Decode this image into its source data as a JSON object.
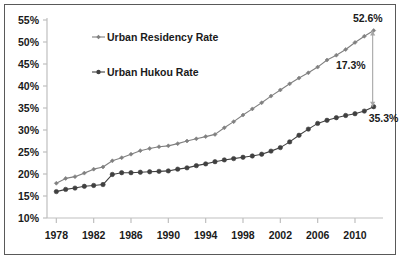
{
  "chart_data": {
    "type": "line",
    "title": "",
    "xlabel": "",
    "ylabel": "",
    "xlim": [
      1977,
      2013
    ],
    "ylim": [
      10,
      55
    ],
    "ytick_labels": [
      "55%",
      "50%",
      "45%",
      "40%",
      "35%",
      "30%",
      "25%",
      "20%",
      "15%",
      "10%"
    ],
    "ytick_values": [
      55,
      50,
      45,
      40,
      35,
      30,
      25,
      20,
      15,
      10
    ],
    "xtick_labels": [
      "1978",
      "1982",
      "1986",
      "1990",
      "1994",
      "1998",
      "2002",
      "2006",
      "2010"
    ],
    "xtick_values": [
      1978,
      1982,
      1986,
      1990,
      1994,
      1998,
      2002,
      2006,
      2010
    ],
    "grid": false,
    "legend_position": "upper-left-inside",
    "x": [
      1978,
      1979,
      1980,
      1981,
      1982,
      1983,
      1984,
      1985,
      1986,
      1987,
      1988,
      1989,
      1990,
      1991,
      1992,
      1993,
      1994,
      1995,
      1996,
      1997,
      1998,
      1999,
      2000,
      2001,
      2002,
      2003,
      2004,
      2005,
      2006,
      2007,
      2008,
      2009,
      2010,
      2011,
      2012
    ],
    "series": [
      {
        "name": "Urban Residency Rate",
        "color": "#808080",
        "marker": "diamond",
        "values": [
          17.9,
          19.0,
          19.4,
          20.2,
          21.1,
          21.6,
          23.0,
          23.7,
          24.5,
          25.3,
          25.8,
          26.2,
          26.4,
          26.9,
          27.5,
          28.0,
          28.5,
          29.0,
          30.5,
          31.9,
          33.4,
          34.8,
          36.2,
          37.7,
          39.1,
          40.5,
          41.8,
          43.0,
          44.3,
          45.9,
          47.0,
          48.3,
          49.9,
          51.3,
          52.6
        ]
      },
      {
        "name": "Urban Hukou Rate",
        "color": "#404040",
        "marker": "circle",
        "values": [
          16.0,
          16.5,
          16.8,
          17.2,
          17.4,
          17.6,
          19.9,
          20.3,
          20.3,
          20.4,
          20.5,
          20.6,
          20.7,
          21.1,
          21.4,
          21.9,
          22.3,
          22.8,
          23.2,
          23.5,
          23.8,
          24.1,
          24.5,
          25.2,
          26.0,
          27.3,
          28.8,
          30.2,
          31.5,
          32.2,
          32.8,
          33.3,
          33.7,
          34.3,
          35.3
        ]
      }
    ],
    "annotations": [
      {
        "name": "residency-end-value",
        "label": "52.6%",
        "x": 2012,
        "y": 52.6
      },
      {
        "name": "gap-value",
        "label": "17.3%",
        "x": 2010,
        "y": 44.0
      },
      {
        "name": "hukou-end-value",
        "label": "35.3%",
        "x": 2012,
        "y": 35.3
      }
    ]
  },
  "legend": {
    "items": [
      {
        "label": "Urban Residency Rate"
      },
      {
        "label": "Urban Hukou Rate"
      }
    ]
  },
  "colors": {
    "residency": "#808080",
    "hukou": "#404040",
    "axis": "#bfbfbf",
    "frame": "#595959",
    "text": "#1a1a1a"
  }
}
